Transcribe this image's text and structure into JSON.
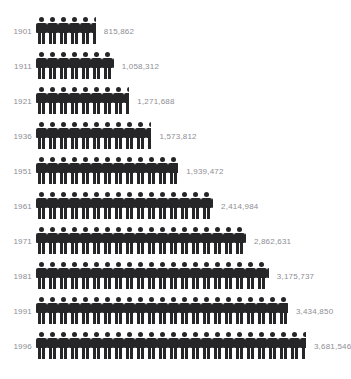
{
  "chart_title": "",
  "chart_data": {
    "type": "bar",
    "subtype": "pictogram",
    "title": "",
    "xlabel": "",
    "ylabel": "",
    "unit_per_icon": 150000,
    "icon": "person-icon",
    "icon_color": "#262629",
    "label_color": "#8e8e94",
    "categories": [
      "1901",
      "1911",
      "1921",
      "1936",
      "1951",
      "1961",
      "1971",
      "1981",
      "1991",
      "1996"
    ],
    "values": [
      815862,
      1058312,
      1271688,
      1573812,
      1939472,
      2414984,
      2862631,
      3175737,
      3434850,
      3681546
    ],
    "value_labels": [
      "815,862",
      "1,058,312",
      "1,271,688",
      "1,573,812",
      "1,939,472",
      "2,414,984",
      "2,862,631",
      "3,175,737",
      "3,434,850",
      "3,681,546"
    ],
    "icon_counts": [
      5.44,
      7.06,
      8.48,
      10.49,
      12.93,
      16.1,
      19.08,
      21.17,
      22.9,
      24.54
    ],
    "legend": [],
    "grid": false
  },
  "rows": [
    {
      "year": "1901",
      "value_label": "815,862"
    },
    {
      "year": "1911",
      "value_label": "1,058,312"
    },
    {
      "year": "1921",
      "value_label": "1,271,688"
    },
    {
      "year": "1936",
      "value_label": "1,573,812"
    },
    {
      "year": "1951",
      "value_label": "1,939,472"
    },
    {
      "year": "1961",
      "value_label": "2,414,984"
    },
    {
      "year": "1971",
      "value_label": "2,862,631"
    },
    {
      "year": "1981",
      "value_label": "3,175,737"
    },
    {
      "year": "1991",
      "value_label": "3,434,850"
    },
    {
      "year": "1996",
      "value_label": "3,681,546"
    }
  ]
}
